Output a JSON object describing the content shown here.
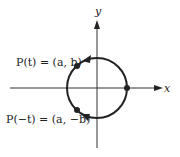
{
  "diagram": {
    "axes": {
      "x_label": "x",
      "y_label": "y"
    },
    "circle": {
      "description": "unit circle centered at origin",
      "stroke_color": "#222222"
    },
    "points": [
      {
        "id": "p_t",
        "label": "P(t) = (a, b)"
      },
      {
        "id": "p_neg_t",
        "label": "P(−t) = (a, −b)"
      },
      {
        "id": "start",
        "label": ""
      }
    ],
    "arrows": [
      {
        "id": "upper-arc-arrow",
        "direction": "counterclockwise"
      },
      {
        "id": "lower-arc-arrow",
        "direction": "clockwise"
      }
    ]
  }
}
